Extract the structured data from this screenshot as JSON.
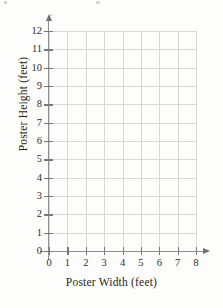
{
  "chart_data": {
    "type": "scatter",
    "title": "",
    "subtitle": "",
    "xlabel": "Poster Width (feet)",
    "ylabel": "Poster Height (feet)",
    "xlim": [
      0,
      8
    ],
    "ylim": [
      0,
      12
    ],
    "xticks": [
      "0",
      "1",
      "2",
      "3",
      "4",
      "5",
      "6",
      "7",
      "8"
    ],
    "yticks": [
      "0",
      "1",
      "2",
      "3",
      "4",
      "5",
      "6",
      "7",
      "8",
      "9",
      "10",
      "11",
      "12"
    ],
    "xtick_values": [
      0,
      1,
      2,
      3,
      4,
      5,
      6,
      7,
      8
    ],
    "ytick_values": [
      0,
      1,
      2,
      3,
      4,
      5,
      6,
      7,
      8,
      9,
      10,
      11,
      12
    ],
    "x_major_step": 1,
    "y_major_step": 1,
    "grid": true,
    "grid_color": "#d8d8da",
    "legend": false,
    "legend_position": "none",
    "annotations": [],
    "series": [
      {
        "name": "",
        "x": [],
        "y": [],
        "values": []
      }
    ]
  },
  "axes": {
    "x_axis_arrow": true,
    "y_axis_arrow": true,
    "axis_color": "#8e8e92"
  },
  "colors": {
    "background": "#fdfdfc",
    "grid": "#d8d8da",
    "axis": "#8e8e92",
    "text": "#1f1f21"
  }
}
